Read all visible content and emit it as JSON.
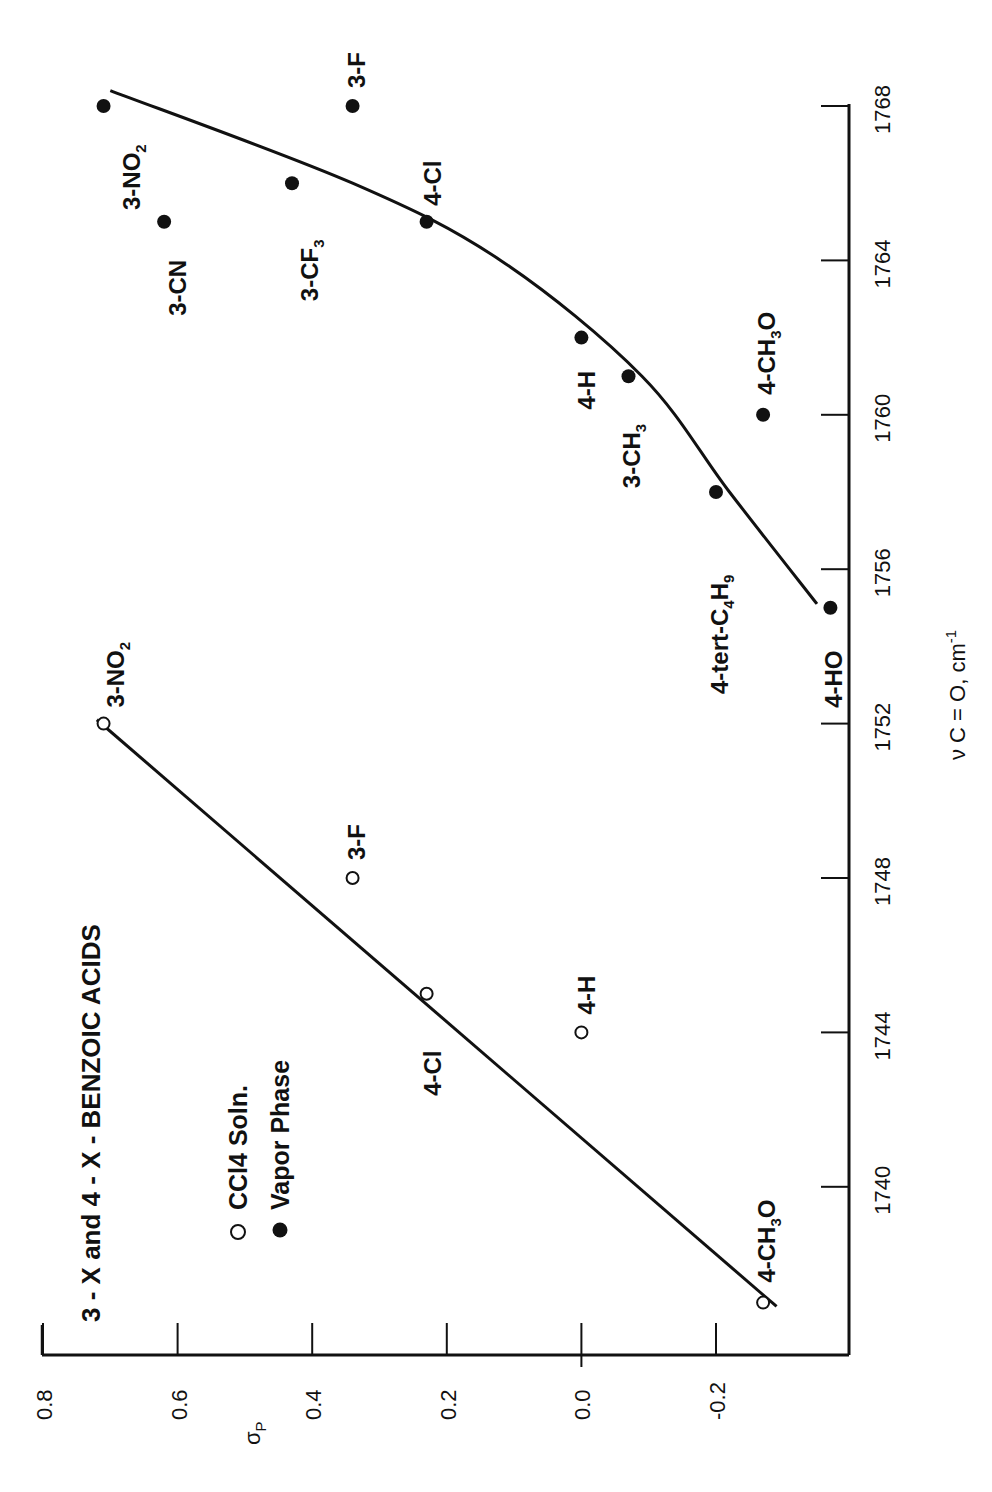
{
  "chart_data": {
    "type": "scatter",
    "title": "3 - X and 4 - X - BENZOIC ACIDS",
    "orientation": "rotated 90° counter-clockwise (x-axis on right, y-axis on bottom)",
    "xlabel": "ν C = O, cm⁻¹",
    "xlabel_parts": {
      "main": "ν C = O, cm",
      "sup": "-1"
    },
    "ylabel": "σP",
    "ylabel_parts": {
      "main": "σ",
      "sub": "P"
    },
    "xlim": [
      1736,
      1769
    ],
    "ylim": [
      -0.4,
      0.8
    ],
    "x_ticks": [
      1740,
      1744,
      1748,
      1752,
      1756,
      1760,
      1764,
      1768
    ],
    "x_tick_labels": [
      "1740",
      "1744",
      "1748",
      "1752",
      "1756",
      "1760",
      "1764",
      "1768"
    ],
    "y_ticks": [
      0.8,
      0.6,
      0.4,
      0.2,
      0.0,
      -0.2
    ],
    "y_tick_labels": [
      "0.8",
      "0.6",
      "0.4",
      "0.2",
      "0.0",
      "-0.2"
    ],
    "grid": false,
    "legend": [
      {
        "marker": "open-circle",
        "label": "CCl4 Soln."
      },
      {
        "marker": "filled-circle",
        "label": "Vapor Phase"
      }
    ],
    "series": [
      {
        "name": "CCl4 Soln.",
        "marker": "open-circle",
        "points": [
          {
            "label": "3-NO2",
            "label_main": "3-NO",
            "label_sub": "2",
            "label_tail": "",
            "x": 1752,
            "y": 0.71
          },
          {
            "label": "3-F",
            "label_main": "3-F",
            "label_sub": "",
            "label_tail": "",
            "x": 1748,
            "y": 0.34
          },
          {
            "label": "4-Cl",
            "label_main": "4-Cl",
            "label_sub": "",
            "label_tail": "",
            "x": 1745,
            "y": 0.23
          },
          {
            "label": "4-H",
            "label_main": "4-H",
            "label_sub": "",
            "label_tail": "",
            "x": 1744,
            "y": 0.0
          },
          {
            "label": "4-CH3O",
            "label_main": "4-CH",
            "label_sub": "3",
            "label_tail": "O",
            "x": 1737,
            "y": -0.27
          }
        ],
        "fit_line": [
          [
            1736.9,
            -0.29
          ],
          [
            1752.1,
            0.72
          ]
        ]
      },
      {
        "name": "Vapor Phase",
        "marker": "filled-circle",
        "points": [
          {
            "label": "3-NO2",
            "label_main": "3-NO",
            "label_sub": "2",
            "label_tail": "",
            "x": 1768,
            "y": 0.71
          },
          {
            "label": "3-CN",
            "label_main": "3-CN",
            "label_sub": "",
            "label_tail": "",
            "x": 1765,
            "y": 0.62
          },
          {
            "label": "3-CF3",
            "label_main": "3-CF",
            "label_sub": "3",
            "label_tail": "",
            "x": 1766,
            "y": 0.43
          },
          {
            "label": "3-F",
            "label_main": "3-F",
            "label_sub": "",
            "label_tail": "",
            "x": 1768,
            "y": 0.34
          },
          {
            "label": "4-Cl",
            "label_main": "4-Cl",
            "label_sub": "",
            "label_tail": "",
            "x": 1765,
            "y": 0.23
          },
          {
            "label": "4-H",
            "label_main": "4-H",
            "label_sub": "",
            "label_tail": "",
            "x": 1762,
            "y": 0.0
          },
          {
            "label": "3-CH3",
            "label_main": "3-CH",
            "label_sub": "3",
            "label_tail": "",
            "x": 1761,
            "y": -0.07
          },
          {
            "label": "4-CH3O",
            "label_main": "4-CH",
            "label_sub": "3",
            "label_tail": "O",
            "x": 1760,
            "y": -0.27
          },
          {
            "label": "4-tert-C4H9",
            "label_main": "4-tert-C",
            "label_sub": "4",
            "label_tail": "H",
            "label_sub2": "9",
            "x": 1758,
            "y": -0.2
          },
          {
            "label": "4-HO",
            "label_main": "4-HO",
            "label_sub": "",
            "label_tail": "",
            "x": 1755,
            "y": -0.37
          }
        ],
        "fit_curve": [
          [
            1755.1,
            -0.35
          ],
          [
            1758,
            -0.22
          ],
          [
            1761,
            -0.09
          ],
          [
            1764,
            0.12
          ],
          [
            1766,
            0.34
          ],
          [
            1768.4,
            0.7
          ]
        ]
      }
    ]
  }
}
